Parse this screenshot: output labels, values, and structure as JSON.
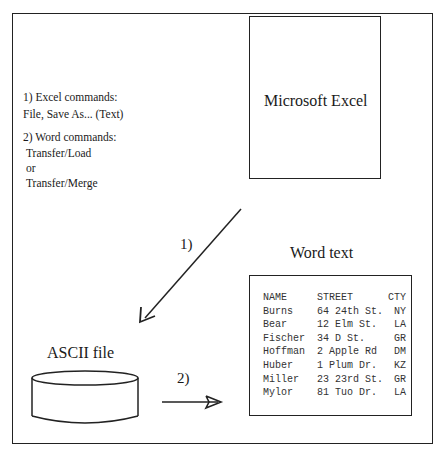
{
  "diagram": {
    "excel": {
      "label": "Microsoft Excel"
    },
    "instructions": {
      "step1_title": "1) Excel commands:",
      "step1_cmd": "File, Save As... (Text)",
      "step2_title": "2) Word commands:",
      "step2_cmd1": "Transfer/Load",
      "step2_or": "or",
      "step2_cmd2": "Transfer/Merge"
    },
    "arrow1_label": "1)",
    "arrow2_label": "2)",
    "ascii": {
      "label": "ASCII file"
    },
    "word": {
      "title": "Word text",
      "columns": [
        "NAME",
        "STREET",
        "CTY"
      ],
      "rows": [
        [
          "Burns",
          "64 24th St.",
          "NY"
        ],
        [
          "Bear",
          "12 Elm St.",
          "LA"
        ],
        [
          "Fischer",
          "34 D St.",
          "GR"
        ],
        [
          "Hoffman",
          "2 Apple Rd",
          "DM"
        ],
        [
          "Huber",
          "1 Plum Dr.",
          "KZ"
        ],
        [
          "Miller",
          "23 23rd St.",
          "GR"
        ],
        [
          "Mylor",
          "81 Tuo Dr.",
          "LA"
        ]
      ]
    }
  }
}
